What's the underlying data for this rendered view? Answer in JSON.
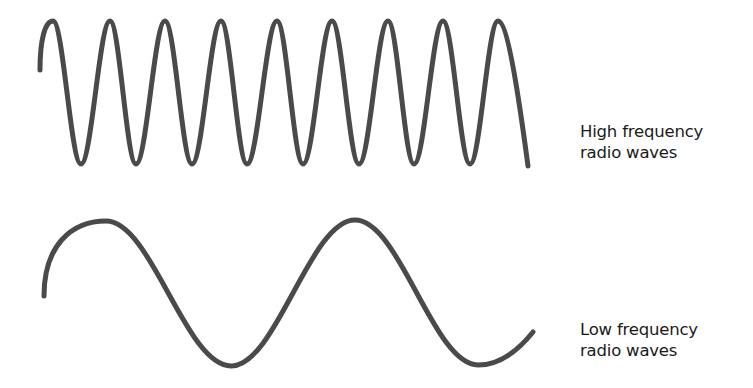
{
  "diagram": {
    "stroke_color": "#4a4a4a",
    "text_color": "#1a1a1a",
    "high_frequency": {
      "label_line1": "High frequency",
      "label_line2": "radio waves",
      "start": [
        40,
        70
      ],
      "peaks_x": [
        53,
        110,
        165,
        221,
        277,
        332,
        388,
        443,
        498
      ],
      "troughs_x": [
        81,
        136,
        192,
        247,
        303,
        359,
        414,
        470
      ],
      "peak_y": 21,
      "trough_y": 164,
      "end": [
        528,
        166
      ]
    },
    "low_frequency": {
      "label_line1": "Low frequency",
      "label_line2": "radio waves",
      "start": [
        44,
        296
      ],
      "peaks": [
        [
          106,
          221
        ],
        [
          355,
          220
        ]
      ],
      "troughs": [
        [
          231,
          366
        ],
        [
          478,
          365
        ]
      ],
      "end": [
        533,
        332
      ]
    }
  }
}
